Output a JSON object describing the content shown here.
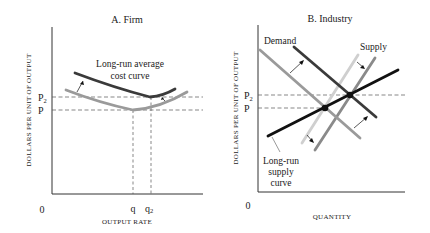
{
  "panels": [
    {
      "id": "firm",
      "title": "A. Firm",
      "ylabel": "DOLLARS PER UNIT OF OUTPUT",
      "xlabel": "OUTPUT RATE",
      "origin": "0",
      "y_ticks": [
        {
          "label": "P",
          "sub": "2"
        },
        {
          "label": "P",
          "sub": ""
        }
      ],
      "x_ticks": [
        {
          "label": "q",
          "sub": ""
        },
        {
          "label": "q",
          "sub": "2"
        }
      ],
      "curve_label_line1": "Long-run average",
      "curve_label_line2": "cost curve",
      "curves": [
        {
          "name": "Initial long-run average cost curve",
          "color": "#9a9a9a",
          "min_at": "q",
          "min_value": "P"
        },
        {
          "name": "Shifted long-run average cost curve",
          "color": "#3a3a3a",
          "min_at": "q2",
          "min_value": "P2"
        }
      ]
    },
    {
      "id": "industry",
      "title": "B. Industry",
      "ylabel": "DOLLARS PER UNIT OF OUTPUT",
      "xlabel": "QUANTITY",
      "origin": "0",
      "y_ticks": [
        {
          "label": "P",
          "sub": "2"
        },
        {
          "label": "P",
          "sub": ""
        }
      ],
      "demand_label": "Demand",
      "supply_label": "Supply",
      "lrs_label_line1": "Long-run",
      "lrs_label_line2": "supply",
      "lrs_label_line3": "curve",
      "curves": [
        {
          "name": "Initial demand",
          "color": "#9a9a9a"
        },
        {
          "name": "Shifted demand",
          "color": "#3a3a3a"
        },
        {
          "name": "Initial supply",
          "color": "#cfcfcf"
        },
        {
          "name": "Shifted supply",
          "color": "#8a8a8a"
        },
        {
          "name": "Long-run supply curve",
          "color": "#111111"
        }
      ],
      "equilibria": [
        {
          "price": "P",
          "note": "initial equilibrium"
        },
        {
          "price": "P2",
          "note": "new equilibrium"
        }
      ]
    }
  ],
  "colors": {
    "axis": "#333333",
    "dashed": "#555555",
    "dark_curve": "#3a3a3a",
    "light_curve": "#9a9a9a",
    "lrs": "#111111"
  }
}
